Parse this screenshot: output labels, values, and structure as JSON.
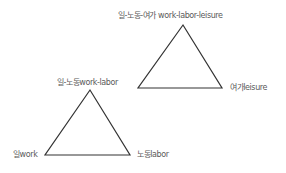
{
  "diagram": {
    "upper_triangle": {
      "apex": "일-노동-여가 work-labor-leisure",
      "left": "일-노동work-labor",
      "right": "여가leisure"
    },
    "lower_triangle": {
      "apex": "일-노동work-labor",
      "left": "일work",
      "right": "노동labor"
    },
    "colors": {
      "line": "#333333",
      "text": "#5a5a5a",
      "background": "#ffffff"
    }
  }
}
